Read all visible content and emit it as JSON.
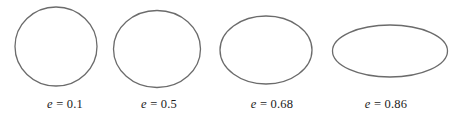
{
  "figure": {
    "background_color": "#ffffff",
    "stroke_color": "#6b6b6b",
    "stroke_width": 1.3,
    "width": 458,
    "height": 117
  },
  "chart_data": {
    "type": "diagram",
    "title": "",
    "subtitle": "",
    "xlabel": "",
    "ylabel": "",
    "grid": false,
    "legend": "none",
    "symbol": "e",
    "separator": "=",
    "categories": [
      "e = 0.1",
      "e = 0.5",
      "e = 0.68",
      "e = 0.86"
    ],
    "values": [
      0.1,
      0.5,
      0.68,
      0.86
    ],
    "shapes": [
      {
        "index": 0,
        "eccentricity": 0.1,
        "label_symbol": "e",
        "label_eq": "= 0.1",
        "value_text": "0.1",
        "cx": 56,
        "cy": 46.5,
        "rx": 41,
        "ry": 39.5,
        "label_x": 65,
        "label_y": 98
      },
      {
        "index": 1,
        "eccentricity": 0.5,
        "label_symbol": "e",
        "label_eq": "= 0.5",
        "value_text": "0.5",
        "cx": 157,
        "cy": 49,
        "rx": 43.5,
        "ry": 38.5,
        "label_x": 159,
        "label_y": 98
      },
      {
        "index": 2,
        "eccentricity": 0.68,
        "label_symbol": "e",
        "label_eq": "= 0.68",
        "value_text": "0.68",
        "cx": 266,
        "cy": 50,
        "rx": 46,
        "ry": 34,
        "label_x": 272,
        "label_y": 98
      },
      {
        "index": 3,
        "eccentricity": 0.86,
        "label_symbol": "e",
        "label_eq": "= 0.86",
        "value_text": "0.86",
        "cx": 390,
        "cy": 51,
        "rx": 57.5,
        "ry": 26,
        "label_x": 386,
        "label_y": 98
      }
    ]
  }
}
